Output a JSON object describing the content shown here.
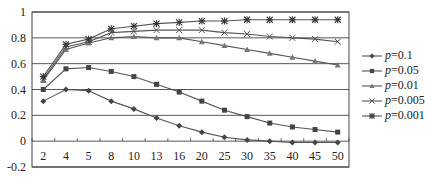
{
  "chart_data": {
    "type": "line",
    "title": "",
    "xlabel": "",
    "ylabel": "",
    "categories": [
      "2",
      "4",
      "5",
      "8",
      "10",
      "13",
      "16",
      "20",
      "25",
      "30",
      "35",
      "40",
      "45",
      "50"
    ],
    "ylim": [
      -0.2,
      1
    ],
    "yticks": [
      "1",
      "0.8",
      "0.6",
      "0.4",
      "0.2",
      "0",
      "-0.2"
    ],
    "grid": true,
    "legend_position": "right",
    "series": [
      {
        "name": "p=0.1",
        "p_label": "p",
        "p_value": "=0.1",
        "marker": "diamond",
        "values": [
          0.31,
          0.4,
          0.39,
          0.31,
          0.25,
          0.18,
          0.12,
          0.07,
          0.03,
          0.01,
          0.0,
          -0.01,
          -0.01,
          -0.01
        ]
      },
      {
        "name": "p=0.05",
        "p_label": "p",
        "p_value": "=0.05",
        "marker": "square",
        "values": [
          0.4,
          0.56,
          0.57,
          0.54,
          0.5,
          0.44,
          0.38,
          0.31,
          0.24,
          0.19,
          0.14,
          0.11,
          0.09,
          0.07
        ]
      },
      {
        "name": "p=0.01",
        "p_label": "p",
        "p_value": "=0.01",
        "marker": "triangle",
        "values": [
          0.47,
          0.71,
          0.76,
          0.8,
          0.81,
          0.8,
          0.8,
          0.77,
          0.74,
          0.71,
          0.68,
          0.65,
          0.62,
          0.59
        ]
      },
      {
        "name": "p=0.005",
        "p_label": "p",
        "p_value": "=0.005",
        "marker": "x",
        "values": [
          0.48,
          0.73,
          0.77,
          0.84,
          0.85,
          0.86,
          0.86,
          0.86,
          0.84,
          0.83,
          0.81,
          0.8,
          0.79,
          0.77
        ]
      },
      {
        "name": "p=0.001",
        "p_label": "p",
        "p_value": "=0.001",
        "marker": "star",
        "values": [
          0.5,
          0.75,
          0.79,
          0.87,
          0.89,
          0.91,
          0.92,
          0.93,
          0.93,
          0.94,
          0.94,
          0.94,
          0.94,
          0.94
        ]
      }
    ]
  },
  "colors": {
    "line": "#555555",
    "grid": "#444444",
    "text": "#222222"
  }
}
